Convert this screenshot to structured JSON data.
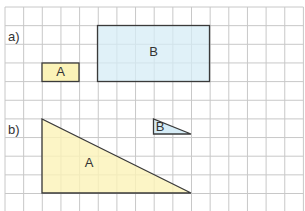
{
  "grid": {
    "origin_x": 5,
    "origin_y": 7,
    "cell": 18.65,
    "cols": 16,
    "rows": 11,
    "line_color": "#c8c8c8",
    "background": "#ffffff"
  },
  "colors": {
    "yellow_fill": "#fbf3b8",
    "blue_fill": "#d6ecf6",
    "outline": "#3a3a3a"
  },
  "parts": [
    {
      "label": "a)",
      "shapes": [
        {
          "name": "A",
          "type": "rectangle",
          "col": 2,
          "row": 3,
          "width_cells": 2,
          "height_cells": 1,
          "fill": "yellow"
        },
        {
          "name": "B",
          "type": "rectangle",
          "col": 5,
          "row": 1,
          "width_cells": 6,
          "height_cells": 3,
          "fill": "blue"
        }
      ]
    },
    {
      "label": "b)",
      "shapes": [
        {
          "name": "A",
          "type": "right-triangle",
          "base_cells": 8,
          "height_cells": 4,
          "fill": "yellow"
        },
        {
          "name": "B",
          "type": "right-triangle",
          "base_cells": 2,
          "height_cells": 1,
          "fill": "blue"
        }
      ]
    }
  ]
}
